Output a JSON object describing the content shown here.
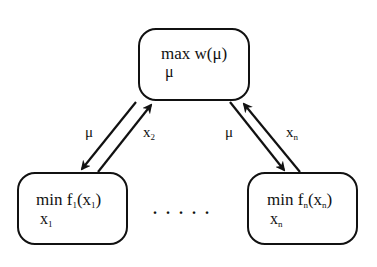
{
  "diagram": {
    "type": "dual decomposition",
    "master": {
      "op": "max",
      "func": "w(μ)",
      "var": "μ"
    },
    "subproblems": [
      {
        "op": "min",
        "func_name": "f",
        "index": "1",
        "arg": "x",
        "var": "x",
        "var_index": "1"
      },
      {
        "op": "min",
        "func_name": "f",
        "index": "n",
        "arg": "x",
        "var": "x",
        "var_index": "n"
      }
    ],
    "ellipsis": ".....",
    "edges": [
      {
        "from": "master",
        "to": "sub-1",
        "label": "μ"
      },
      {
        "from": "sub-1",
        "to": "master",
        "label": "x",
        "label_index": "2"
      },
      {
        "from": "master",
        "to": "sub-n",
        "label": "μ"
      },
      {
        "from": "sub-n",
        "to": "master",
        "label": "x",
        "label_index": "n"
      }
    ],
    "colors": {
      "stroke": "#111111",
      "background": "#ffffff"
    }
  }
}
